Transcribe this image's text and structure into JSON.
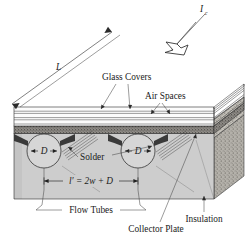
{
  "figure": {
    "labels": {
      "incident_radiation": "I",
      "incident_radiation_sub": "c",
      "length": "L",
      "glass_covers": "Glass Covers",
      "air_spaces": "Air Spaces",
      "solder": "Solder",
      "tube_diameter": "D",
      "spacing_equation": "l′ = 2w + D",
      "flow_tubes": "Flow Tubes",
      "collector_plate": "Collector Plate",
      "insulation": "Insulation"
    },
    "colors": {
      "line": "#2b2b2b",
      "plate_fill": "#cfcfcf",
      "plate_dark": "#6e6e6e",
      "insulation_fill": "#b8b5ae",
      "insulation_side": "#a9a6a0",
      "glass_fill": "#fbfbfb",
      "tube_fill": "#d9d9d9",
      "background": "#ffffff"
    }
  }
}
